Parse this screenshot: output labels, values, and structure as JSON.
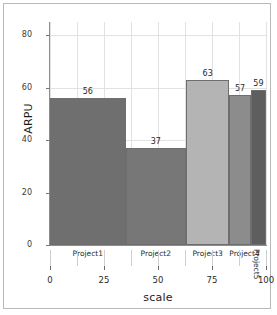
{
  "chart_data": {
    "type": "bar",
    "title": "",
    "subtitle": "",
    "xlabel": "scale",
    "ylabel": "ARPU",
    "categories": [
      "Project1",
      "Project2",
      "Project3",
      "Project4",
      "Project5"
    ],
    "values": [
      56,
      37,
      63,
      57,
      59
    ],
    "widths": [
      35,
      28,
      20,
      10,
      7
    ],
    "x_starts": [
      0,
      35,
      63,
      83,
      93
    ],
    "x_ends": [
      35,
      63,
      83,
      93,
      100
    ],
    "bar_colors": [
      "#6f6f6f",
      "#777777",
      "#b4b4b4",
      "#8c8c8c",
      "#5e5e5e"
    ],
    "bar_border_color": "#6e6e6e",
    "ylim": [
      0,
      85
    ],
    "xlim": [
      0,
      100
    ],
    "yticks": [
      0,
      20,
      40,
      60,
      80
    ],
    "ytick_labels": [
      "0",
      "20",
      "40",
      "60",
      "80"
    ],
    "xticks": [
      0,
      25,
      50,
      75,
      100
    ],
    "xtick_labels": [
      "0",
      "25",
      "50",
      "75",
      "100"
    ],
    "grid": true,
    "grid_color": "#e2e2e2",
    "legend": "none",
    "value_labels": [
      "56",
      "37",
      "63",
      "57",
      "59"
    ],
    "chart_style": "variable-width-bar (marimekko)"
  },
  "axis": {
    "y_title": "ARPU",
    "x_title": "scale"
  },
  "frame": {
    "border_color": "#b9b9b9",
    "background": "#ffffff"
  }
}
